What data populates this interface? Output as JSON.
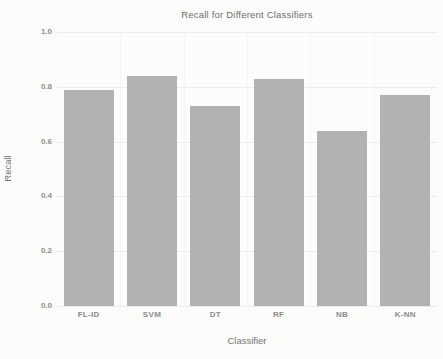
{
  "figure": {
    "background_color": "#fcfcfb",
    "bar_color": "#b3b2b0",
    "gridline_color": "#ececea",
    "text_color": "#6e6e6e"
  },
  "chart_data": {
    "type": "bar",
    "title": "Recall for Different Classifiers",
    "xlabel": "Classifier",
    "ylabel": "Recall",
    "categories": [
      "FL-ID",
      "SVM",
      "DT",
      "RF",
      "NB",
      "K-NN"
    ],
    "values": [
      0.79,
      0.84,
      0.73,
      0.83,
      0.64,
      0.77
    ],
    "ylim": [
      0.0,
      1.0
    ],
    "yticks": [
      1.0,
      0.8,
      0.6,
      0.4,
      0.2,
      0.0
    ],
    "ytick_labels": [
      "1.0",
      "0.8",
      "0.6",
      "0.4",
      "0.2",
      "0.0"
    ],
    "grid": "horizontal major gridlines on, faint vertical category separators, no axis spines",
    "legend": "none",
    "bar_color": "#b3b2b0"
  }
}
